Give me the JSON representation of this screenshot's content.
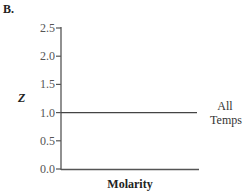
{
  "panel_label": "B.",
  "chart_data": {
    "type": "line",
    "title": "",
    "xlabel": "Molarity",
    "ylabel": "Z",
    "ylim": [
      0.0,
      2.5
    ],
    "yticks": [
      "0.0",
      "0.5",
      "1.0",
      "1.5",
      "2.0",
      "2.5"
    ],
    "grid": false,
    "series": [
      {
        "name": "All Temps",
        "label_lines": [
          "All",
          "Temps"
        ],
        "x": [
          0,
          1
        ],
        "values": [
          1.0,
          1.0
        ]
      }
    ]
  }
}
